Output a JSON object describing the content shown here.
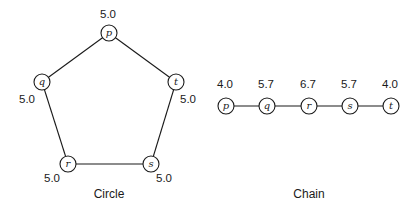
{
  "colors": {
    "stroke": "#1a1a1a",
    "background": "#ffffff"
  },
  "circle": {
    "caption": "Circle",
    "nodes": [
      {
        "id": "p",
        "label": "p",
        "value": "5.0"
      },
      {
        "id": "q",
        "label": "q",
        "value": "5.0"
      },
      {
        "id": "t",
        "label": "t",
        "value": "5.0"
      },
      {
        "id": "r",
        "label": "r",
        "value": "5.0"
      },
      {
        "id": "s",
        "label": "s",
        "value": "5.0"
      }
    ],
    "edges": [
      [
        "p",
        "q"
      ],
      [
        "p",
        "t"
      ],
      [
        "q",
        "r"
      ],
      [
        "t",
        "s"
      ],
      [
        "r",
        "s"
      ]
    ]
  },
  "chain": {
    "caption": "Chain",
    "nodes": [
      {
        "id": "p",
        "label": "p",
        "value": "4.0"
      },
      {
        "id": "q",
        "label": "q",
        "value": "5.7"
      },
      {
        "id": "r",
        "label": "r",
        "value": "6.7"
      },
      {
        "id": "s",
        "label": "s",
        "value": "5.7"
      },
      {
        "id": "t",
        "label": "t",
        "value": "4.0"
      }
    ],
    "edges": [
      [
        "p",
        "q"
      ],
      [
        "q",
        "r"
      ],
      [
        "r",
        "s"
      ],
      [
        "s",
        "t"
      ]
    ]
  }
}
